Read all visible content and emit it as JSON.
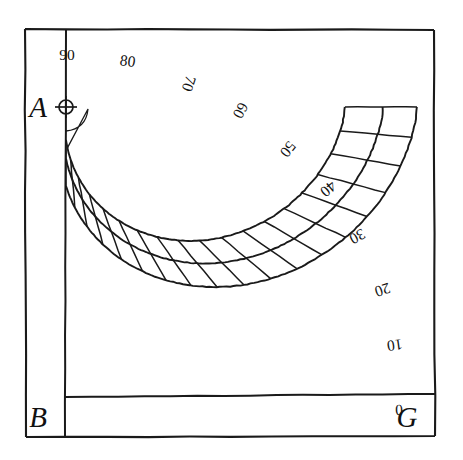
{
  "figure": {
    "type": "geometric-diagram",
    "background_color": "#ffffff",
    "ink_color": "#1a1a1a"
  },
  "geometry": {
    "center_point": {
      "x": 66,
      "y": 107
    },
    "frame": {
      "left": 25,
      "top": 28,
      "right": 435,
      "bottom": 437
    },
    "vertical_axis_x": 66,
    "horizontal_axis_y": 397,
    "arc_radii": {
      "inner_scale_start": 33,
      "inner_scale_end": 79,
      "outer_horizontal_inner": 279,
      "outer_horizontal_mid": 317,
      "outer_horizontal_outer": 351,
      "outer_horizontal_frame": 368
    },
    "band_count": 2,
    "degree_cell_span": 5,
    "quadrant_span_degrees": 90
  },
  "labels": {
    "corners": [
      {
        "id": "point-a",
        "text": "A",
        "x": 38,
        "y": 117,
        "note": "center of the quadrant, marked with a crossed circle"
      },
      {
        "id": "point-b",
        "text": "B",
        "x": 38,
        "y": 427,
        "note": "foot of the vertical limb"
      },
      {
        "id": "point-g",
        "text": "G",
        "x": 407,
        "y": 427,
        "note": "end of the horizontal limb"
      }
    ],
    "hub": {
      "cx": 66,
      "cy": 107,
      "r": 7,
      "name": "center-crosshair"
    }
  },
  "scale": {
    "name": "degree-scale",
    "unit": "degrees",
    "direction": "counter-clockwise from horizontal limb G (0) to vertical limb A (90)",
    "ticks": [
      {
        "value": "90",
        "degrees": 90,
        "x": 67,
        "y": 60,
        "rotate": 0
      },
      {
        "value": "80",
        "degrees": 80,
        "x": 127,
        "y": 66,
        "rotate": 8
      },
      {
        "value": "70",
        "degrees": 70,
        "x": 184,
        "y": 82,
        "rotate": 108
      },
      {
        "value": "60",
        "degrees": 60,
        "x": 236,
        "y": 108,
        "rotate": 118
      },
      {
        "value": "50",
        "degrees": 50,
        "x": 284,
        "y": 146,
        "rotate": 128
      },
      {
        "value": "40",
        "degrees": 40,
        "x": 325,
        "y": 185,
        "rotate": 140
      },
      {
        "value": "30",
        "degrees": 30,
        "x": 355,
        "y": 232,
        "rotate": 152
      },
      {
        "value": "20",
        "degrees": 20,
        "x": 381,
        "y": 285,
        "rotate": 162
      },
      {
        "value": "10",
        "degrees": 10,
        "x": 394,
        "y": 340,
        "rotate": 172
      },
      {
        "value": "0",
        "degrees": 0,
        "x": 399,
        "y": 405,
        "rotate": 178
      }
    ]
  },
  "radial_divisions": {
    "name": "degree-cell-dividers",
    "description": "Radial lines subdividing the two arc bands into 5-degree cells across the 90-degree quadrant",
    "step_degrees": 5
  }
}
